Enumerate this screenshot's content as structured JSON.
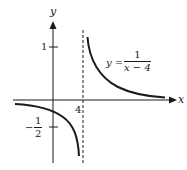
{
  "diagram": {
    "type": "function-graph",
    "function": "y = 1/(x - 4)",
    "axes": {
      "x_label": "x",
      "y_label": "y"
    },
    "tick_labels": {
      "x_tick": "4",
      "y_tick_positive": "1",
      "y_tick_negative_sign": "−",
      "y_tick_negative_num": "1",
      "y_tick_negative_den": "2"
    },
    "equation_label": {
      "lhs": "y =",
      "numerator": "1",
      "denominator": "x − 4"
    },
    "asymptote": {
      "vertical": "x = 4",
      "style": "dashed"
    },
    "colors": {
      "ink": "#1a1a1a",
      "background": "#ffffff"
    }
  }
}
